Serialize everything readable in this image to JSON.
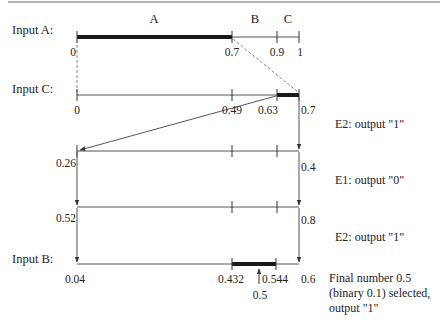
{
  "diagram": {
    "type": "arithmetic-coding-interval-diagram",
    "colors": {
      "line": "#555555",
      "bar": "#1a1a1a",
      "dashed": "#888888",
      "rule": "#999999"
    },
    "segments_row_a": [
      {
        "label": "A",
        "from": 0,
        "to": 0.7
      },
      {
        "label": "B",
        "from": 0.7,
        "to": 0.9
      },
      {
        "label": "C",
        "from": 0.9,
        "to": 1
      }
    ],
    "rows": [
      {
        "id": "row-input-a",
        "label": "Input A:",
        "ticks": [
          "0",
          "0.7",
          "0.9",
          "1"
        ],
        "selected": [
          "0",
          "0.7"
        ]
      },
      {
        "id": "row-input-c",
        "label": "Input C:",
        "ticks": [
          "0",
          "0.49",
          "0.63",
          "0.7"
        ],
        "selected": [
          "0.63",
          "0.7"
        ]
      },
      {
        "id": "row-e2-1",
        "label": "",
        "ticks": [
          "0.26",
          "0.4"
        ],
        "note": "E2: output \"1\""
      },
      {
        "id": "row-e1",
        "label": "",
        "ticks": [
          "0.52",
          "0.8"
        ],
        "note": "E1: output \"0\""
      },
      {
        "id": "row-input-b",
        "label": "Input B:",
        "ticks": [
          "0.04",
          "0.432",
          "0.544",
          "0.6"
        ],
        "selected": [
          "0.432",
          "0.544"
        ],
        "note_above": "E2: output \"1\"",
        "marker": "0.5",
        "note": [
          "Final number 0.5",
          "(binary 0.1) selected,",
          "output \"1\""
        ]
      }
    ]
  }
}
